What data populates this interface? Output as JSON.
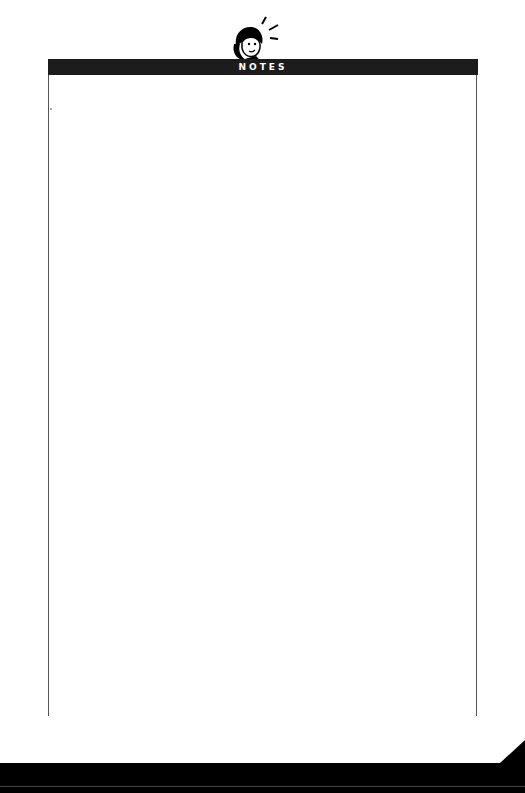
{
  "header": {
    "title": "NOTES",
    "icon": "person-thinking-icon",
    "bar_color": "#1c1c1c",
    "text_color": "#ffffff"
  },
  "page": {
    "background": "#ffffff",
    "bottom_band_color": "#000000"
  }
}
